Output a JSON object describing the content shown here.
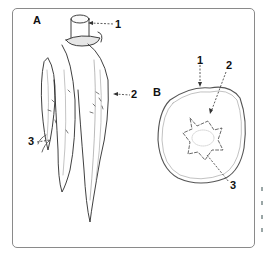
{
  "figure": {
    "panels": [
      {
        "id": "A",
        "label": "A",
        "subject": "whole tuberous root",
        "callouts": [
          {
            "number": "1"
          },
          {
            "number": "2"
          },
          {
            "number": "3"
          }
        ]
      },
      {
        "id": "B",
        "label": "B",
        "subject": "transverse section",
        "callouts": [
          {
            "number": "1"
          },
          {
            "number": "2"
          },
          {
            "number": "3"
          }
        ]
      }
    ],
    "colors": {
      "ink": "#222222",
      "frame": "#8a8a8a",
      "background": "#ffffff"
    }
  }
}
